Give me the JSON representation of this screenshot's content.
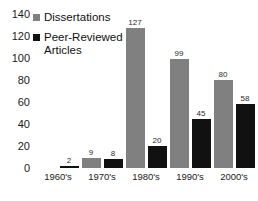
{
  "chart_data": {
    "type": "bar",
    "title": "",
    "subtitle": "",
    "xlabel": "",
    "ylabel": "",
    "categories": [
      "1960's",
      "1970's",
      "1980's",
      "1990's",
      "2000's"
    ],
    "series": [
      {
        "name": "Dissertations",
        "color": "#808080",
        "values": [
          0,
          9,
          127,
          99,
          80
        ],
        "labels": [
          "",
          "9",
          "127",
          "99",
          "80"
        ]
      },
      {
        "name": "Peer-Reviewed Articles",
        "color": "#111111",
        "values": [
          2,
          8,
          20,
          45,
          58
        ],
        "labels": [
          "2",
          "8",
          "20",
          "45",
          "58"
        ]
      }
    ],
    "ylim": [
      0,
      140
    ],
    "ytick_step": 20,
    "yticks": [
      "140",
      "120",
      "100",
      "80",
      "60",
      "40",
      "20",
      "0"
    ],
    "grid": false,
    "axis_lines": false,
    "legend_position": "top-left"
  },
  "legend": {
    "entries": [
      {
        "label": "Dissertations",
        "swatch": "gray-square-icon"
      },
      {
        "label": "Peer-Reviewed Articles",
        "swatch": "black-square-icon"
      }
    ]
  }
}
